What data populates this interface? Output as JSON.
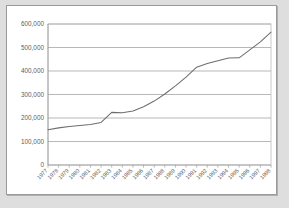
{
  "chart_data": {
    "type": "line",
    "title": "",
    "subtitle": "",
    "xlabel": "",
    "ylabel": "",
    "grid": true,
    "legend": false,
    "legend_position": "none",
    "xlim": [
      1977,
      1998
    ],
    "ylim": [
      0,
      600000
    ],
    "ytick_labels": [
      "600,000",
      "500,000",
      "400,000",
      "300,000",
      "200,000",
      "100,000",
      "0"
    ],
    "yticks": [
      600000,
      500000,
      400000,
      300000,
      200000,
      100000,
      0
    ],
    "categories": [
      "1977",
      "1978",
      "1979",
      "1980",
      "1981",
      "1982",
      "1983",
      "1984",
      "1985",
      "1986",
      "1987",
      "1988",
      "1989",
      "1990",
      "1991",
      "1992",
      "1993",
      "1994",
      "1995",
      "1996",
      "1997",
      "1998"
    ],
    "x": [
      1977,
      1978,
      1979,
      1980,
      1981,
      1982,
      1983,
      1984,
      1985,
      1986,
      1987,
      1988,
      1989,
      1990,
      1991,
      1992,
      1993,
      1994,
      1995,
      1996,
      1997,
      1998
    ],
    "values": [
      150000,
      158000,
      164000,
      168000,
      172000,
      181000,
      224000,
      222000,
      230000,
      248000,
      272000,
      302000,
      337000,
      374000,
      416000,
      432000,
      444000,
      455000,
      456000,
      490000,
      524000,
      565000
    ],
    "series": [
      {
        "name": "",
        "values": [
          150000,
          158000,
          164000,
          168000,
          172000,
          181000,
          224000,
          222000,
          230000,
          248000,
          272000,
          302000,
          337000,
          374000,
          416000,
          432000,
          444000,
          455000,
          456000,
          490000,
          524000,
          565000
        ]
      }
    ],
    "colors": {
      "line": "#6e6e6e",
      "grid": "#999999",
      "axis": "#8a8a8a",
      "plot_background": "#ffffff",
      "page_background": "#dedede",
      "frame_border": "#9a9a9a",
      "label_text": "#5d5d5d"
    },
    "xlabel_rotation": -45
  }
}
